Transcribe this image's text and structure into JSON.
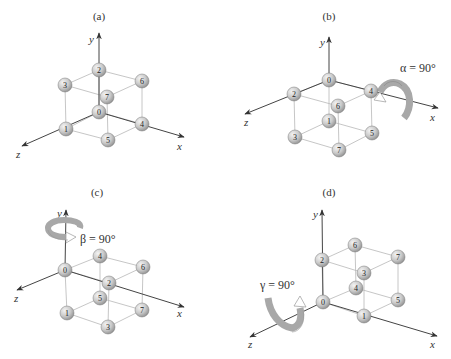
{
  "figure": {
    "colors": {
      "axis": "#444444",
      "edge": "#b8b8b8",
      "ball_light": "#f4f4f4",
      "ball_mid": "#c9c9c9",
      "ball_dark": "#8d8d8d",
      "arrow_fill": "#a8a8a8",
      "arrow_tail": "#ffffff"
    },
    "ball_radius": 7,
    "panels": [
      {
        "id": "a",
        "label": "(a)",
        "label_pos": [
          99,
          20
        ],
        "origin": [
          99,
          112
        ],
        "axes": {
          "y": {
            "end": [
              99,
              33
            ],
            "label": "y",
            "label_pos": [
              89,
              43
            ]
          },
          "x": {
            "end": [
              184,
              137
            ],
            "label": "x",
            "label_pos": [
              177,
              150
            ]
          },
          "z": {
            "end": [
              22,
              146
            ],
            "label": "z",
            "label_pos": [
              16,
              158
            ]
          }
        },
        "balls": [
          {
            "n": "2",
            "pos": [
              99,
              70
            ]
          },
          {
            "n": "3",
            "pos": [
              65,
              85
            ]
          },
          {
            "n": "6",
            "pos": [
              142,
              81
            ]
          },
          {
            "n": "7",
            "pos": [
              107,
              97
            ]
          },
          {
            "n": "0",
            "pos": [
              99,
              112
            ]
          },
          {
            "n": "1",
            "pos": [
              66,
              129
            ]
          },
          {
            "n": "4",
            "pos": [
              142,
              124
            ]
          },
          {
            "n": "5",
            "pos": [
              108,
              140
            ]
          }
        ],
        "rotation": null
      },
      {
        "id": "b",
        "label": "(b)",
        "label_pos": [
          329,
          20
        ],
        "origin": [
          329,
          80
        ],
        "axes": {
          "y": {
            "end": [
              329,
              37
            ],
            "label": "y",
            "label_pos": [
              320,
              46
            ]
          },
          "x": {
            "end": [
              438,
              108
            ],
            "label": "x",
            "label_pos": [
              430,
              121
            ]
          },
          "z": {
            "end": [
              245,
              114
            ],
            "label": "z",
            "label_pos": [
              244,
              126
            ]
          }
        },
        "balls": [
          {
            "n": "0",
            "pos": [
              329,
              80
            ]
          },
          {
            "n": "2",
            "pos": [
              294,
              94
            ]
          },
          {
            "n": "4",
            "pos": [
              371,
              91
            ]
          },
          {
            "n": "6",
            "pos": [
              338,
              106
            ]
          },
          {
            "n": "1",
            "pos": [
              329,
              121
            ]
          },
          {
            "n": "3",
            "pos": [
              295,
              137
            ]
          },
          {
            "n": "5",
            "pos": [
              372,
              133
            ]
          },
          {
            "n": "7",
            "pos": [
              339,
              150
            ]
          }
        ],
        "rotation": {
          "axis": "x",
          "label": "α = 90°",
          "label_pos": [
            400,
            72
          ],
          "arrow_icon": "rotation-arrow-x"
        }
      },
      {
        "id": "c",
        "label": "(c)",
        "label_pos": [
          97,
          196
        ],
        "origin": [
          65,
          270
        ],
        "axes": {
          "y": {
            "end": [
              66,
              210
            ],
            "label": "y",
            "label_pos": [
              57,
              217
            ]
          },
          "x": {
            "end": [
              184,
              307
            ],
            "label": "x",
            "label_pos": [
              177,
              317
            ]
          },
          "z": {
            "end": [
              17,
              290
            ],
            "label": "z",
            "label_pos": [
              14,
              302
            ]
          }
        },
        "balls": [
          {
            "n": "4",
            "pos": [
              100,
              256
            ]
          },
          {
            "n": "6",
            "pos": [
              143,
              267
            ]
          },
          {
            "n": "0",
            "pos": [
              65,
              270
            ]
          },
          {
            "n": "2",
            "pos": [
              109,
              283
            ]
          },
          {
            "n": "5",
            "pos": [
              100,
              298
            ]
          },
          {
            "n": "1",
            "pos": [
              67,
              313
            ]
          },
          {
            "n": "7",
            "pos": [
              142,
              310
            ]
          },
          {
            "n": "3",
            "pos": [
              108,
              327
            ]
          }
        ],
        "rotation": {
          "axis": "y",
          "label": "β = 90°",
          "label_pos": [
            80,
            243
          ],
          "arrow_icon": "rotation-arrow-y"
        }
      },
      {
        "id": "d",
        "label": "(d)",
        "label_pos": [
          329,
          196
        ],
        "origin": [
          323,
          302
        ],
        "axes": {
          "y": {
            "end": [
              322,
              210
            ],
            "label": "y",
            "label_pos": [
              313,
              218
            ]
          },
          "x": {
            "end": [
              437,
              336
            ],
            "label": "x",
            "label_pos": [
              430,
              348
            ]
          },
          "z": {
            "end": [
              250,
              337
            ],
            "label": "z",
            "label_pos": [
              248,
              348
            ]
          }
        },
        "balls": [
          {
            "n": "6",
            "pos": [
              355,
              245
            ]
          },
          {
            "n": "7",
            "pos": [
              398,
              257
            ]
          },
          {
            "n": "2",
            "pos": [
              322,
              260
            ]
          },
          {
            "n": "3",
            "pos": [
              364,
              273
            ]
          },
          {
            "n": "4",
            "pos": [
              356,
              288
            ]
          },
          {
            "n": "0",
            "pos": [
              323,
              302
            ]
          },
          {
            "n": "5",
            "pos": [
              398,
              300
            ]
          },
          {
            "n": "1",
            "pos": [
              364,
              316
            ]
          }
        ],
        "rotation": {
          "axis": "z",
          "label": "γ = 90°",
          "label_pos": [
            260,
            289
          ],
          "arrow_icon": "rotation-arrow-z"
        }
      }
    ]
  }
}
